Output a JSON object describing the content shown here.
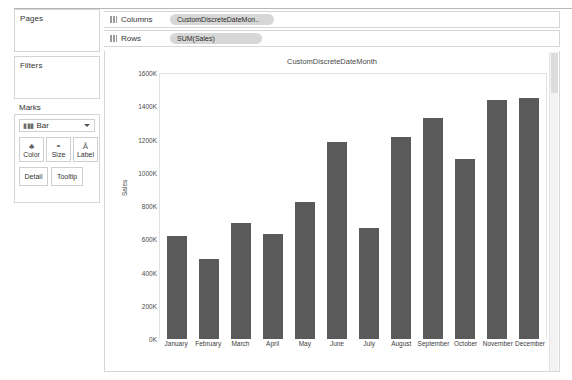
{
  "sidebar": {
    "pages": {
      "title": "Pages"
    },
    "filters": {
      "title": "Filters"
    },
    "marks": {
      "title": "Marks",
      "mark_type": "Bar",
      "mark_type_icon": "bar-chart-icon",
      "caret_icon": "chevron-down-icon",
      "buttons": [
        {
          "label": "Color",
          "icon": "color-palette-icon",
          "glyph": "♣"
        },
        {
          "label": "Size",
          "icon": "size-icon",
          "glyph": "◔"
        },
        {
          "label": "Label",
          "icon": "label-icon",
          "glyph": "A₁"
        },
        {
          "label": "Detail",
          "icon": "detail-icon",
          "glyph": ""
        },
        {
          "label": "Tooltip",
          "icon": "tooltip-icon",
          "glyph": ""
        }
      ]
    }
  },
  "shelves": [
    {
      "name": "Columns",
      "icon": "columns-shelf-icon",
      "pill": "CustomDiscreteDateMon.."
    },
    {
      "name": "Rows",
      "icon": "rows-shelf-icon",
      "pill": "SUM(Sales)"
    }
  ],
  "chart_data": {
    "type": "bar",
    "title": "CustomDiscreteDateMonth",
    "xlabel": "",
    "ylabel": "Sales",
    "ylim": [
      0,
      1600000
    ],
    "grid": false,
    "legend": false,
    "ytick_labels": [
      "1600K",
      "1400K",
      "1200K",
      "1000K",
      "800K",
      "600K",
      "400K",
      "200K",
      "0K"
    ],
    "ytick_values": [
      1600000,
      1400000,
      1200000,
      1000000,
      800000,
      600000,
      400000,
      200000,
      0
    ],
    "categories": [
      "January",
      "February",
      "March",
      "April",
      "May",
      "June",
      "July",
      "August",
      "September",
      "October",
      "November",
      "December"
    ],
    "values": [
      620000,
      480000,
      700000,
      630000,
      825000,
      1185000,
      670000,
      1215000,
      1330000,
      1080000,
      1440000,
      1450000
    ],
    "bar_color": "#5a5a5a"
  }
}
